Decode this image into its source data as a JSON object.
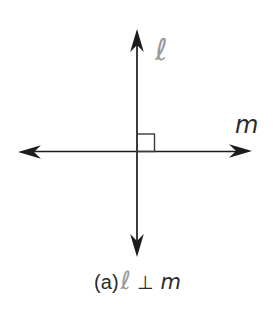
{
  "figure": {
    "background_color": "#ffffff",
    "line_color": "#1c1c1c",
    "type": "perpendicular-lines-diagram",
    "right_angle_marker": "small square at intersection, upper-right quadrant",
    "labels": {
      "vertical_line": {
        "text": "ℓ",
        "color": "#9a9a9a"
      },
      "horizontal_line": {
        "text": "m",
        "color": "#2b2b2b"
      }
    },
    "caption": {
      "index": "(a)",
      "line1": "ℓ",
      "relation": "⊥",
      "line2": "m",
      "full_text": "(a) ℓ ⊥ m"
    }
  }
}
